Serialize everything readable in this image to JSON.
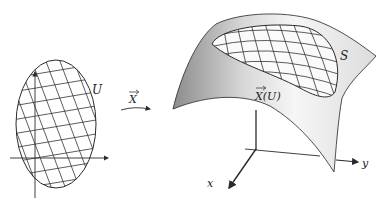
{
  "figure": {
    "domain_label": "U",
    "map_label": "X",
    "image_label": "X(U)",
    "surface_label": "S",
    "axes": {
      "x": "x",
      "y": "y"
    }
  },
  "colors": {
    "line": "#2a2a2a",
    "surface_dark": "#8f8f8f",
    "surface_light": "#f4f4f4",
    "background": "#ffffff"
  }
}
